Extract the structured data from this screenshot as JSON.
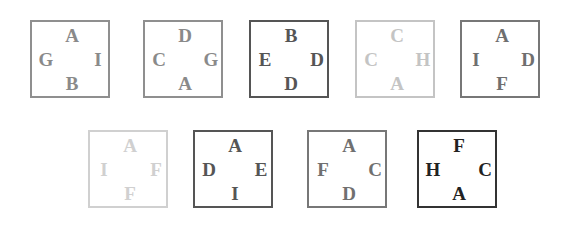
{
  "panels": [
    {
      "top": "A",
      "left": "G",
      "right": "I",
      "bottom": "B",
      "color": "#8a8a8a",
      "border": "#8f8f8f",
      "x": 30,
      "y": 20
    },
    {
      "top": "D",
      "left": "C",
      "right": "G",
      "bottom": "A",
      "color": "#8a8a8a",
      "border": "#8f8f8f",
      "x": 143,
      "y": 20
    },
    {
      "top": "B",
      "left": "E",
      "right": "D",
      "bottom": "D",
      "color": "#555555",
      "border": "#555555",
      "x": 249,
      "y": 20
    },
    {
      "top": "C",
      "left": "C",
      "right": "H",
      "bottom": "A",
      "color": "#c4c4c4",
      "border": "#c4c4c4",
      "x": 355,
      "y": 20
    },
    {
      "top": "A",
      "left": "I",
      "right": "D",
      "bottom": "F",
      "color": "#6f6f6f",
      "border": "#777777",
      "x": 460,
      "y": 20
    },
    {
      "top": "A",
      "left": "I",
      "right": "F",
      "bottom": "F",
      "color": "#d0d0d0",
      "border": "#d0d0d0",
      "x": 88,
      "y": 130
    },
    {
      "top": "A",
      "left": "D",
      "right": "E",
      "bottom": "I",
      "color": "#555555",
      "border": "#555555",
      "x": 193,
      "y": 130
    },
    {
      "top": "A",
      "left": "F",
      "right": "C",
      "bottom": "D",
      "color": "#707070",
      "border": "#777777",
      "x": 307,
      "y": 130
    },
    {
      "top": "F",
      "left": "H",
      "right": "C",
      "bottom": "A",
      "color": "#222222",
      "border": "#333333",
      "x": 417,
      "y": 130
    }
  ]
}
